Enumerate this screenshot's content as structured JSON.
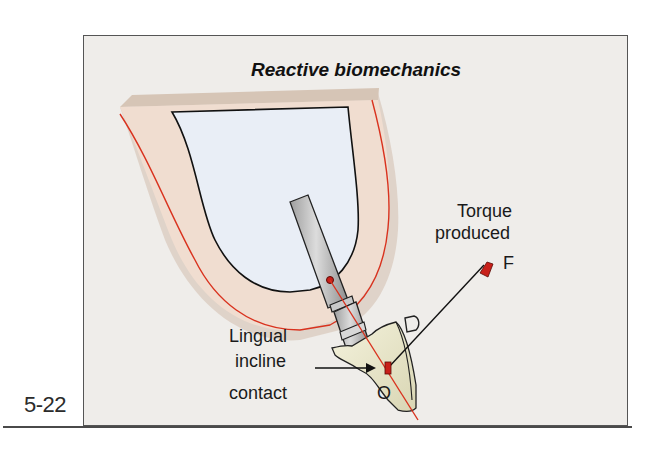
{
  "figure": {
    "number": "5-22",
    "title": "Reactive biomechanics"
  },
  "labels": {
    "torque_line1": "Torque",
    "torque_line2": "produced",
    "force_point": "F",
    "origin_point": "O",
    "distal_marker": "D",
    "lingual_line1": "Lingual",
    "lingual_line2": "incline",
    "lingual_line3": "contact"
  },
  "colors": {
    "panel_background": "#efedea",
    "bone_cortical": "#f0ddd0",
    "bone_cancellous": "#e9eef6",
    "gingiva_line": "#d9321e",
    "implant_axis": "#d9321e",
    "implant_metal": "#bdbdbd",
    "crown": "#eceacb",
    "force_arrow_head": "#c8201a"
  }
}
